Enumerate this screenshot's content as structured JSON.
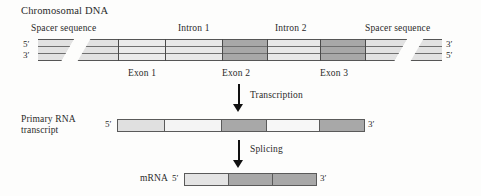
{
  "diagram": {
    "title": "Chromosomal DNA",
    "rows": {
      "dna": {
        "title": "Chromosomal DNA",
        "left_top_prime": "5′",
        "left_bottom_prime": "3′",
        "right_top_prime": "3′",
        "right_bottom_prime": "5′",
        "top_labels": [
          "Spacer sequence",
          "Intron 1",
          "Intron 2",
          "Spacer sequence"
        ],
        "bottom_labels": [
          "Exon 1",
          "Exon 2",
          "Exon 3"
        ],
        "segments": [
          {
            "name": "spacer-sequence-left",
            "kind": "spacer",
            "color": "#e2e2e2"
          },
          {
            "name": "exon-1",
            "kind": "exon-light",
            "color": "#ebebeb"
          },
          {
            "name": "intron-1",
            "kind": "intron",
            "color": "#e8e8e8"
          },
          {
            "name": "exon-2",
            "kind": "exon-dark",
            "color": "#a8a8a8"
          },
          {
            "name": "intron-2",
            "kind": "intron",
            "color": "#e8e8e8"
          },
          {
            "name": "exon-3",
            "kind": "exon-dark",
            "color": "#a8a8a8"
          },
          {
            "name": "spacer-sequence-right",
            "kind": "spacer",
            "color": "#e2e2e2"
          }
        ]
      },
      "transcription": {
        "label": "Transcription"
      },
      "primary_rna": {
        "title_line1": "Primary RNA",
        "title_line2": "transcript",
        "left_prime": "5′",
        "right_prime": "3′",
        "segments": [
          {
            "name": "exon-1",
            "color": "#e0e0e0"
          },
          {
            "name": "intron-1",
            "color": "#f4f4f4"
          },
          {
            "name": "exon-2",
            "color": "#a8a8a8"
          },
          {
            "name": "intron-2",
            "color": "#f7f7f7"
          },
          {
            "name": "exon-3",
            "color": "#a8a8a8"
          }
        ]
      },
      "splicing": {
        "label": "Splicing"
      },
      "mrna": {
        "title": "mRNA",
        "left_prime": "5′",
        "right_prime": "3′",
        "segments": [
          {
            "name": "exon-1",
            "color": "#e4e4e4"
          },
          {
            "name": "exon-2",
            "color": "#a8a8a8"
          },
          {
            "name": "exon-3",
            "color": "#a8a8a8"
          }
        ]
      }
    },
    "colors": {
      "exon_dark": "#a8a8a8",
      "intron_light": "#eaeaea",
      "spacer": "#e2e2e2",
      "outline": "#5a5a5a",
      "text": "#2a2a2a",
      "background": "#fdfdfc"
    }
  }
}
